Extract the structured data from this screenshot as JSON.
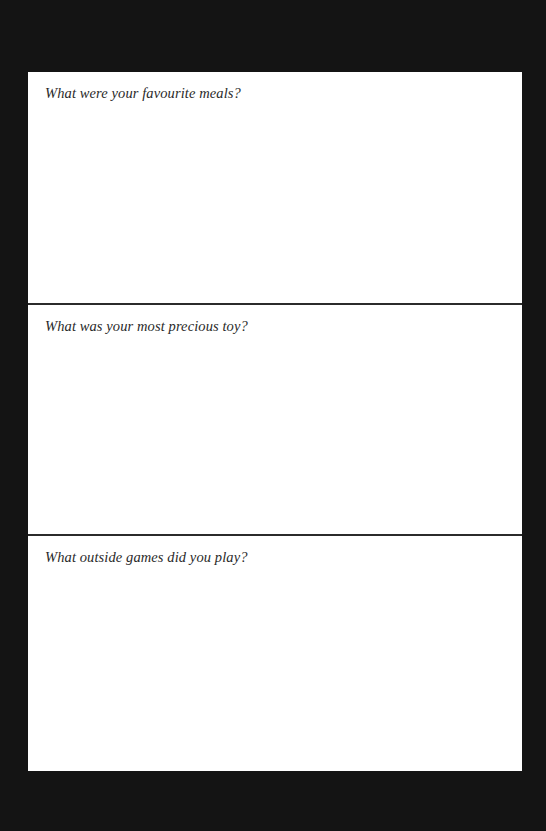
{
  "document": {
    "sections": [
      {
        "prompt": "What were your favourite meals?",
        "answer": ""
      },
      {
        "prompt": "What was your most precious toy?",
        "answer": ""
      },
      {
        "prompt": "What outside games did you play?",
        "answer": ""
      }
    ],
    "colors": {
      "background": "#141414",
      "page": "#ffffff",
      "divider": "#2b2b2b",
      "text": "#2a2a2a"
    }
  }
}
